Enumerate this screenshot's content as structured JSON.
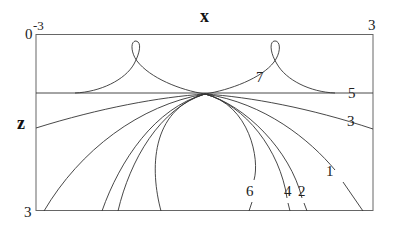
{
  "diagram": {
    "axis_labels": {
      "x": "x",
      "z": "z"
    },
    "ticks": {
      "x_left": "-3",
      "x_right": "3",
      "z_top": "0",
      "z_bottom": "3"
    },
    "curve_labels": [
      "1",
      "2",
      "3",
      "4",
      "5",
      "6",
      "7"
    ]
  },
  "labels": {
    "l1": "1",
    "l2": "2",
    "l3": "3",
    "l4": "4",
    "l5": "5",
    "l6": "6",
    "l7": "7"
  },
  "colors": {
    "line": "#333333",
    "frame": "#555555",
    "background": "#ffffff"
  }
}
